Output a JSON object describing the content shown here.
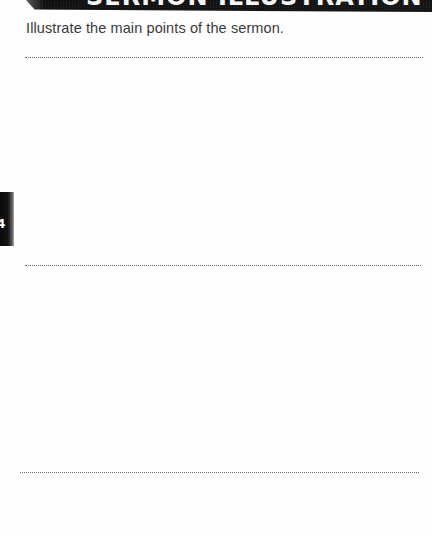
{
  "page": {
    "type": "worksheet",
    "background_color": "#ffffff"
  },
  "banner": {
    "title": "SERMON ILLUSTRATION",
    "background_color": "#111111",
    "text_color": "#f4f4f4",
    "clipped": true
  },
  "instruction": {
    "text": "Illustrate the main points of the sermon.",
    "color": "#3a3a3a"
  },
  "lines": [
    {
      "id": "line-1",
      "style": "dotted",
      "color": "#6a6a6a"
    },
    {
      "id": "line-2",
      "style": "dotted",
      "color": "#6a6a6a"
    },
    {
      "id": "line-3",
      "style": "dotted",
      "color": "#6a6a6a"
    }
  ],
  "side_tab": {
    "mark": "4",
    "background_color": "#0a0a0a",
    "mark_color": "#ffffff",
    "clipped": true
  },
  "writing_areas": [
    {
      "id": "area-1",
      "content": ""
    },
    {
      "id": "area-2",
      "content": ""
    },
    {
      "id": "area-3",
      "content": ""
    }
  ]
}
